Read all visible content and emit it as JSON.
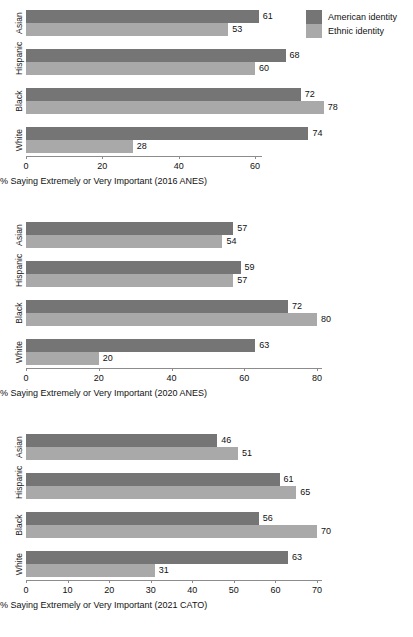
{
  "legend": {
    "position": "top-right",
    "entries": [
      {
        "label": "American identity",
        "color": "#757575",
        "key": "american"
      },
      {
        "label": "Ethnic identity",
        "color": "#a9a9a9",
        "key": "ethnic"
      }
    ]
  },
  "chart_data": [
    {
      "type": "bar",
      "orientation": "horizontal",
      "title": "",
      "xlabel": "% Saying Extremely or Very Important (2016 ANES)",
      "ylabel": "",
      "categories": [
        "Asian",
        "Hispanic",
        "Black",
        "White"
      ],
      "series": [
        {
          "name": "American identity",
          "color": "#757575",
          "values": [
            61,
            68,
            72,
            74
          ]
        },
        {
          "name": "Ethnic identity",
          "color": "#a9a9a9",
          "values": [
            53,
            60,
            78,
            28
          ]
        }
      ],
      "xlim": [
        0,
        60
      ],
      "xticks": [
        0,
        20,
        40,
        60
      ],
      "grid": false
    },
    {
      "type": "bar",
      "orientation": "horizontal",
      "title": "",
      "xlabel": "% Saying Extremely or Very Important (2020 ANES)",
      "ylabel": "",
      "categories": [
        "Asian",
        "Hispanic",
        "Black",
        "White"
      ],
      "series": [
        {
          "name": "American identity",
          "color": "#757575",
          "values": [
            57,
            59,
            72,
            63
          ]
        },
        {
          "name": "Ethnic identity",
          "color": "#a9a9a9",
          "values": [
            54,
            57,
            80,
            20
          ]
        }
      ],
      "xlim": [
        0,
        80
      ],
      "xticks": [
        0,
        20,
        40,
        60,
        80
      ],
      "grid": false
    },
    {
      "type": "bar",
      "orientation": "horizontal",
      "title": "",
      "xlabel": "% Saying Extremely or Very Important (2021 CATO)",
      "ylabel": "",
      "categories": [
        "Asian",
        "Hispanic",
        "Black",
        "White"
      ],
      "series": [
        {
          "name": "American identity",
          "color": "#757575",
          "values": [
            46,
            61,
            56,
            63
          ]
        },
        {
          "name": "Ethnic identity",
          "color": "#a9a9a9",
          "values": [
            51,
            65,
            70,
            31
          ]
        }
      ],
      "xlim": [
        0,
        70
      ],
      "xticks": [
        0,
        10,
        20,
        30,
        40,
        50,
        60,
        70
      ],
      "grid": false
    }
  ]
}
